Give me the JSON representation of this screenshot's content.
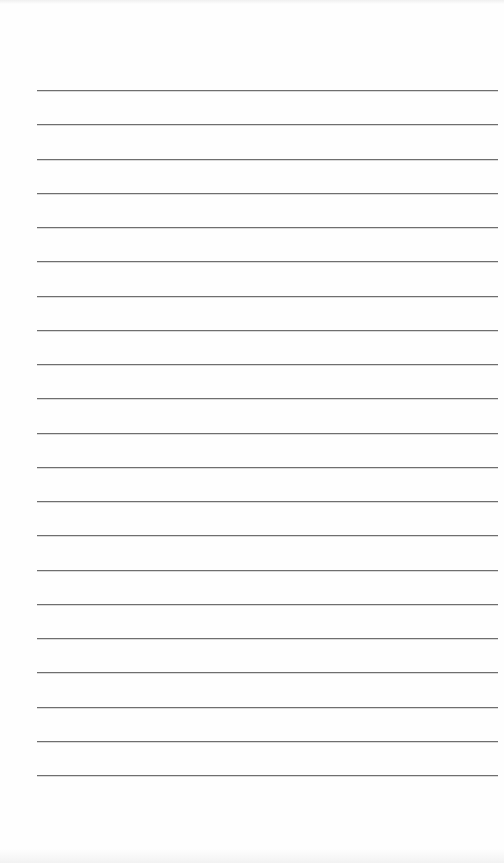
{
  "page": {
    "type": "lined-paper",
    "background_color": "#fefefe",
    "line_color": "#6e6e6e",
    "line_count": 21,
    "line_left_px": 37,
    "line_right_px": 498,
    "first_line_y_px": 90,
    "line_spacing_px": 34.25
  }
}
